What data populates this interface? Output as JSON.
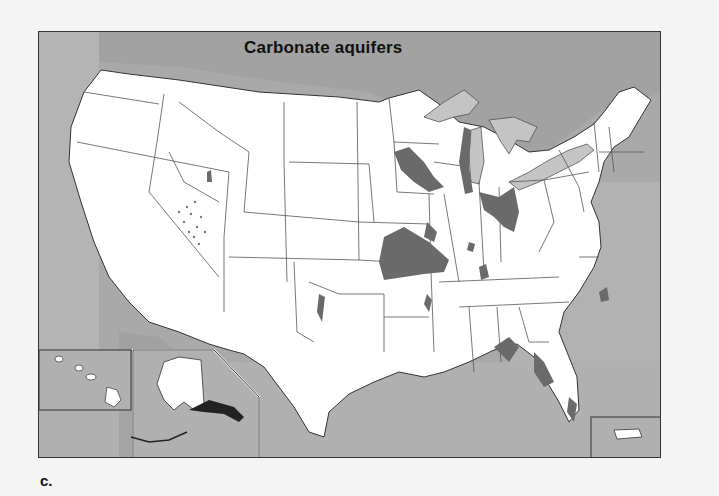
{
  "map": {
    "title": "Carbonate aquifers",
    "panel_label": "c.",
    "region": "United States",
    "insets": [
      "Hawaii",
      "Alaska",
      "Puerto Rico"
    ],
    "colors": {
      "ocean": "#a9a9a9",
      "ocean_light": "#b8b8b8",
      "land": "#ffffff",
      "great_lakes": "#c4c4c4",
      "carbonate_aquifer": "#6a6a6a",
      "state_border": "#555555",
      "frame_border": "#333333",
      "page_background": "#f4f4f4"
    },
    "legend": {
      "aquifer_label": "Carbonate aquifers"
    }
  }
}
